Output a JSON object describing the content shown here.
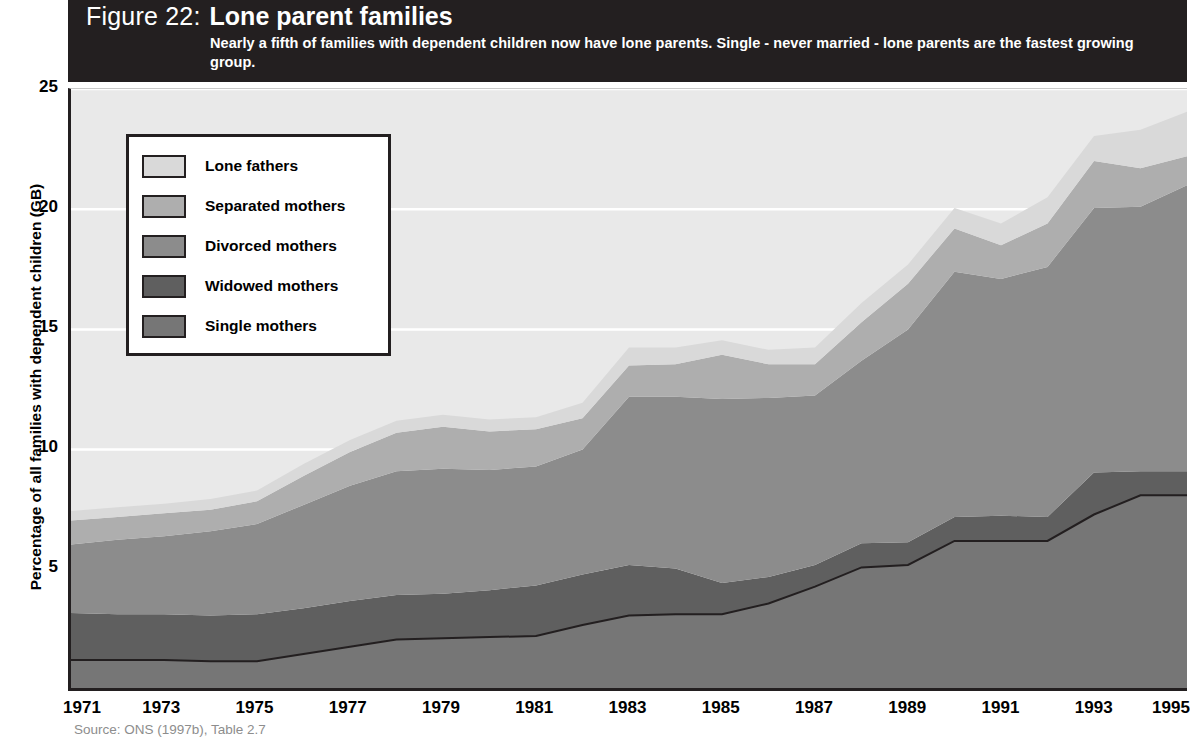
{
  "header": {
    "figure_label": "Figure 22:",
    "figure_title": "Lone parent families",
    "subtitle": "Nearly a fifth of families with dependent children now have lone parents. Single - never married - lone parents are the fastest growing group."
  },
  "source": "Source: ONS (1997b), Table 2.7",
  "colors": {
    "header_bg": "#231f20",
    "plot_bg": "#e9e9e9",
    "gridline": "#ffffff",
    "axis": "#231f20",
    "lone_fathers": "#d9d9d9",
    "separated_mothers": "#aeaeae",
    "divorced_mothers": "#8c8c8c",
    "widowed_mothers": "#5f5f5f",
    "single_mothers": "#767676",
    "single_line": "#231f20"
  },
  "legend": {
    "items": [
      {
        "label": "Lone fathers",
        "color": "#d9d9d9"
      },
      {
        "label": "Separated mothers",
        "color": "#aeaeae"
      },
      {
        "label": "Divorced mothers",
        "color": "#8c8c8c"
      },
      {
        "label": "Widowed mothers",
        "color": "#5f5f5f"
      },
      {
        "label": "Single mothers",
        "color": "#767676"
      }
    ]
  },
  "chart_data": {
    "type": "area",
    "title": "Lone parent families",
    "subtitle": "Nearly a fifth of families with dependent children now have lone parents. Single - never married - lone parents are the fastest growing group.",
    "xlabel": "",
    "ylabel": "Percentage of all families with dependent children (GB)",
    "ylim": [
      0,
      25
    ],
    "yticks": [
      5,
      10,
      15,
      20,
      25
    ],
    "xlim": [
      1971,
      1995
    ],
    "xticks": [
      1971,
      1973,
      1975,
      1977,
      1979,
      1981,
      1983,
      1985,
      1987,
      1989,
      1991,
      1993,
      1995
    ],
    "grid": true,
    "legend_position": "upper-left-inside",
    "stacked": true,
    "stack_order_bottom_to_top": [
      "Single mothers",
      "Widowed mothers",
      "Divorced mothers",
      "Separated mothers",
      "Lone fathers"
    ],
    "x": [
      1971,
      1972,
      1973,
      1974,
      1975,
      1976,
      1977,
      1978,
      1979,
      1980,
      1981,
      1982,
      1983,
      1984,
      1985,
      1986,
      1987,
      1988,
      1989,
      1990,
      1991,
      1992,
      1993,
      1994,
      1995
    ],
    "series": [
      {
        "name": "Single mothers",
        "color": "#767676",
        "values": [
          1.25,
          1.25,
          1.25,
          1.2,
          1.2,
          1.5,
          1.8,
          2.1,
          2.15,
          2.2,
          2.25,
          2.7,
          3.1,
          3.15,
          3.15,
          3.6,
          4.3,
          5.1,
          5.2,
          6.2,
          6.2,
          6.2,
          7.3,
          8.1,
          8.1
        ]
      },
      {
        "name": "Widowed mothers",
        "color": "#5f5f5f",
        "values": [
          1.95,
          1.9,
          1.9,
          1.9,
          1.95,
          1.9,
          1.9,
          1.85,
          1.85,
          1.95,
          2.1,
          2.1,
          2.1,
          1.9,
          1.3,
          1.1,
          0.9,
          1.0,
          0.95,
          1.0,
          1.05,
          1.0,
          1.75,
          1.0,
          1.0
        ]
      },
      {
        "name": "Divorced mothers",
        "color": "#8c8c8c",
        "values": [
          2.85,
          3.1,
          3.25,
          3.5,
          3.75,
          4.3,
          4.8,
          5.15,
          5.2,
          5.0,
          4.95,
          5.2,
          7.0,
          7.15,
          7.65,
          7.45,
          7.05,
          7.6,
          8.85,
          10.2,
          9.85,
          10.4,
          11.0,
          11.0,
          11.9
        ]
      },
      {
        "name": "Separated mothers",
        "color": "#aeaeae",
        "values": [
          1.0,
          0.95,
          0.95,
          0.9,
          0.95,
          1.2,
          1.4,
          1.6,
          1.75,
          1.6,
          1.55,
          1.3,
          1.3,
          1.35,
          1.85,
          1.4,
          1.3,
          1.6,
          1.9,
          1.8,
          1.4,
          1.8,
          1.95,
          1.6,
          1.2
        ]
      },
      {
        "name": "Lone fathers",
        "color": "#d9d9d9",
        "values": [
          0.4,
          0.4,
          0.4,
          0.45,
          0.45,
          0.5,
          0.5,
          0.5,
          0.5,
          0.5,
          0.5,
          0.65,
          0.75,
          0.7,
          0.6,
          0.6,
          0.7,
          0.8,
          0.8,
          0.85,
          0.9,
          1.1,
          1.05,
          1.6,
          1.85
        ]
      }
    ],
    "totals": [
      7.45,
      7.6,
      7.75,
      7.95,
      8.3,
      9.4,
      10.4,
      11.2,
      11.45,
      11.25,
      11.35,
      11.95,
      12.25,
      12.25,
      14.55,
      14.15,
      14.25,
      16.1,
      17.7,
      20.05,
      19.4,
      20.5,
      23.05,
      23.3,
      24.05
    ]
  }
}
